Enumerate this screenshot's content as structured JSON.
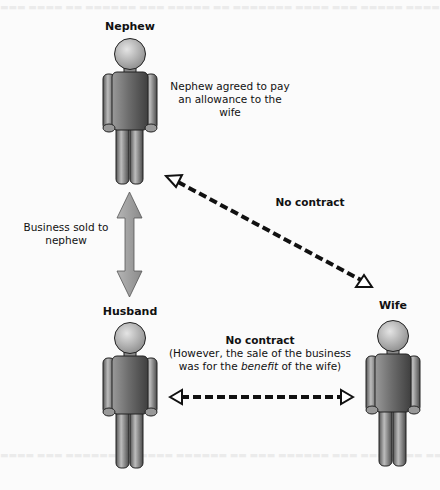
{
  "diagram": {
    "people": {
      "nephew": {
        "label": "Nephew"
      },
      "husband": {
        "label": "Husband"
      },
      "wife": {
        "label": "Wife"
      }
    },
    "annotations": {
      "nephew_agreement": [
        "Nephew agreed to pay",
        "an allowance to the",
        "wife"
      ],
      "business_sold": [
        "Business sold to",
        "nephew"
      ],
      "nephew_wife_relation": "No contract",
      "husband_wife_relation": {
        "title": "No contract",
        "line1": "(However, the sale of the business",
        "line2_prefix": "was for the ",
        "line2_emphasis": "benefit",
        "line2_suffix": " of the wife)"
      }
    },
    "connectors": [
      {
        "from": "husband",
        "to": "nephew",
        "style": "solid-gray-double-arrow"
      },
      {
        "from": "nephew",
        "to": "wife",
        "style": "dashed-black-double-arrow"
      },
      {
        "from": "husband",
        "to": "wife",
        "style": "dashed-black-double-arrow"
      }
    ],
    "colors": {
      "figure_light": "#d8d8d8",
      "figure_dark": "#5a5a5a",
      "outline": "#222222",
      "gray_arrow": "#9a9a9a",
      "dashed_arrow": "#111111"
    }
  }
}
